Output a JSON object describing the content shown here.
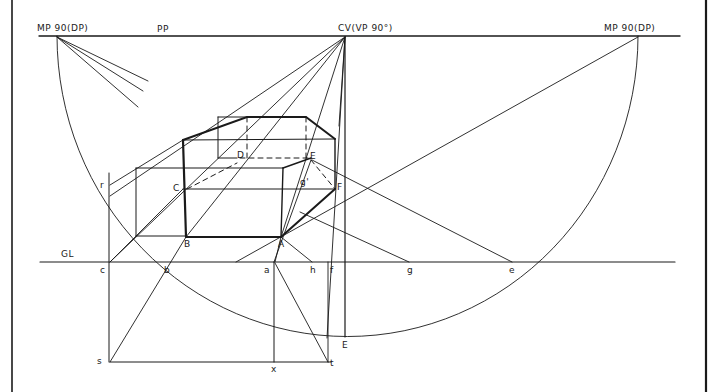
{
  "diagram": {
    "type": "perspective-construction",
    "colors": {
      "ink": "#1a1a1a",
      "paper": "#ffffff"
    },
    "labels": {
      "mp_left": "MP 90(DP)",
      "pp": "PP",
      "cv": "CV(VP 90°)",
      "mp_right": "MP 90(DP)",
      "gl": "GL",
      "A": "A",
      "B": "B",
      "C": "C",
      "D": "D",
      "E": "E",
      "F": "F",
      "g_prime": "g'",
      "r": "r",
      "c": "c",
      "b": "b",
      "a": "a",
      "h": "h",
      "f": "f",
      "g": "g",
      "e": "e",
      "E_low": "E",
      "s": "s",
      "x": "x",
      "t": "t"
    }
  }
}
